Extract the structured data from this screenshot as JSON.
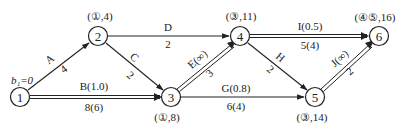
{
  "nodes": [
    {
      "id": "1",
      "label": "1",
      "x": 20,
      "y": 97,
      "annotation": "b₁=0"
    },
    {
      "id": "2",
      "label": "2",
      "x": 98,
      "y": 36,
      "annotation": "(①,4)"
    },
    {
      "id": "3",
      "label": "3",
      "x": 171,
      "y": 97,
      "annotation": "(①,8)"
    },
    {
      "id": "4",
      "label": "4",
      "x": 240,
      "y": 36,
      "annotation": "(③,11)"
    },
    {
      "id": "5",
      "label": "5",
      "x": 315,
      "y": 97,
      "annotation": "(③,14)"
    },
    {
      "id": "6",
      "label": "6",
      "x": 379,
      "y": 36,
      "annotation": "(④⑤,16)"
    }
  ],
  "edges": [
    {
      "id": "A",
      "from": "1",
      "to": "2",
      "top": "A",
      "bottom": "4",
      "double": false
    },
    {
      "id": "B",
      "from": "1",
      "to": "3",
      "top": "B(1.0)",
      "bottom": "8(6)",
      "double": true
    },
    {
      "id": "C",
      "from": "2",
      "to": "3",
      "top": "C",
      "bottom": "2",
      "double": false
    },
    {
      "id": "D",
      "from": "2",
      "to": "4",
      "top": "D",
      "bottom": "2",
      "double": false
    },
    {
      "id": "E",
      "from": "3",
      "to": "4",
      "top": "E(∞)",
      "bottom": "3",
      "double": true
    },
    {
      "id": "G",
      "from": "3",
      "to": "5",
      "top": "G(0.8)",
      "bottom": "6(4)",
      "double": false
    },
    {
      "id": "H",
      "from": "4",
      "to": "5",
      "top": "H",
      "bottom": "2",
      "double": false
    },
    {
      "id": "I",
      "from": "4",
      "to": "6",
      "top": "I(0.5)",
      "bottom": "5(4)",
      "double": true
    },
    {
      "id": "J",
      "from": "5",
      "to": "6",
      "top": "J(∞)",
      "bottom": "2",
      "double": true
    }
  ]
}
